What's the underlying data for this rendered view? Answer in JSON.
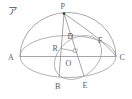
{
  "figure": {
    "option_label": "ア",
    "points": {
      "apex": "P",
      "left_vertex": "A",
      "right_vertex": "C",
      "base_center": "O",
      "inner_point": "R",
      "upper_chord_point": "D",
      "upper_right_point": "F",
      "bottom_left_point": "B",
      "bottom_right_point": "E"
    }
  },
  "colors": {
    "line": "#8f8f8f",
    "thin_line": "#9b9b9b",
    "label": "#5a5a5a",
    "option_label": "#4a4a4a",
    "apex_dot": "#333333",
    "background": "#ffffff"
  }
}
